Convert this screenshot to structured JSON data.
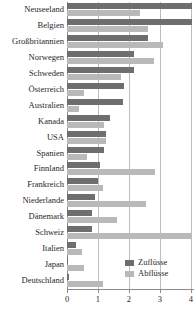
{
  "chart_data": {
    "type": "bar",
    "orientation": "horizontal",
    "title": "",
    "xlabel": "",
    "ylabel": "",
    "xlim": [
      0,
      4.1
    ],
    "xticks": [
      "0",
      "1",
      "2",
      "3",
      "4"
    ],
    "grid": true,
    "legend_position": "bottom-right",
    "categories": [
      "Neuseeland",
      "Belgien",
      "Großbritannien",
      "Norwegen",
      "Schweden",
      "Österreich",
      "Australien",
      "Kanada",
      "USA",
      "Spanien",
      "Finnland",
      "Frankreich",
      "Niederlande",
      "Dänemark",
      "Schweiz",
      "Italien",
      "Japan",
      "Deutschland"
    ],
    "series": [
      {
        "name": "Zuflüsse",
        "color": "#6e6e6e",
        "values": [
          4.05,
          4.05,
          2.6,
          2.15,
          2.15,
          1.85,
          1.8,
          1.4,
          1.25,
          1.2,
          1.05,
          1.0,
          0.9,
          0.8,
          0.8,
          0.3,
          0.02,
          0.05
        ]
      },
      {
        "name": "Abflüsse",
        "color": "#b9b9b9",
        "values": [
          2.35,
          2.6,
          3.1,
          2.8,
          1.75,
          0.55,
          0.4,
          1.2,
          1.25,
          0.65,
          2.85,
          1.15,
          2.55,
          1.6,
          4.05,
          0.5,
          0.55,
          1.15
        ]
      }
    ]
  },
  "legend": {
    "items": [
      {
        "label": "Zuflüsse",
        "key": "inflow"
      },
      {
        "label": "Abflüsse",
        "key": "outflow"
      }
    ]
  }
}
